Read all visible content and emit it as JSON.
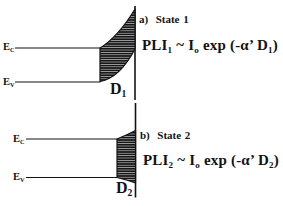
{
  "figure": {
    "colors": {
      "ink": "#131313",
      "background": "#ffffff"
    }
  },
  "panels": [
    {
      "caption": "a)  State 1",
      "labels": {
        "ec": [
          {
            "t": "E"
          },
          {
            "t": "C",
            "sub": true
          }
        ],
        "ev": [
          {
            "t": "E"
          },
          {
            "t": "V",
            "sub": true
          }
        ],
        "d": [
          {
            "t": "D"
          },
          {
            "t": "1",
            "sub": true
          }
        ]
      },
      "formula": [
        {
          "t": "PLI"
        },
        {
          "t": "1",
          "sub": true
        },
        {
          "t": " ~ I"
        },
        {
          "t": "o",
          "sub": true
        },
        {
          "t": " exp (-α’ D"
        },
        {
          "t": "1",
          "sub": true
        },
        {
          "t": ")"
        }
      ]
    },
    {
      "caption": "b)  State 2",
      "labels": {
        "ec": [
          {
            "t": "E"
          },
          {
            "t": "C",
            "sub": true
          }
        ],
        "ev": [
          {
            "t": "E"
          },
          {
            "t": "V",
            "sub": true
          }
        ],
        "d": [
          {
            "t": "D"
          },
          {
            "t": "2",
            "sub": true
          }
        ]
      },
      "formula": [
        {
          "t": "PLI"
        },
        {
          "t": "2",
          "sub": true
        },
        {
          "t": " ~ I"
        },
        {
          "t": "o",
          "sub": true
        },
        {
          "t": " exp (-α’ D"
        },
        {
          "t": "2",
          "sub": true
        },
        {
          "t": ")"
        }
      ]
    }
  ]
}
